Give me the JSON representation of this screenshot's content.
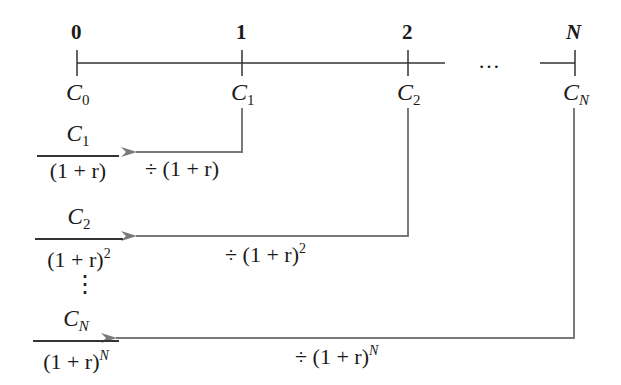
{
  "timeline": {
    "periods": [
      "0",
      "1",
      "2",
      "N"
    ],
    "ellipsis": "…",
    "cash_flows": [
      {
        "base": "C",
        "sub": "0"
      },
      {
        "base": "C",
        "sub": "1"
      },
      {
        "base": "C",
        "sub": "2"
      },
      {
        "base": "C",
        "sub": "N"
      }
    ]
  },
  "discounted": [
    {
      "num_base": "C",
      "num_sub": "1",
      "den": "(1 + r)",
      "den_exp": ""
    },
    {
      "num_base": "C",
      "num_sub": "2",
      "den": "(1 + r)",
      "den_exp": "2"
    },
    {
      "num_base": "C",
      "num_sub": "N",
      "den": "(1 + r)",
      "den_exp": "N"
    }
  ],
  "operations": [
    {
      "label": "÷ (1 + r)",
      "exp": ""
    },
    {
      "label": "÷ (1 + r)",
      "exp": "2"
    },
    {
      "label": "÷ (1 + r)",
      "exp": "N"
    }
  ],
  "vdots": "⋮",
  "colors": {
    "line": "#333333",
    "arrow": "#7a7a7a"
  }
}
